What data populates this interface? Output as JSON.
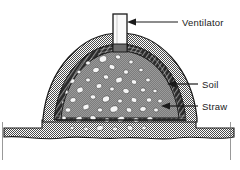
{
  "figure": {
    "type": "technical-cross-section-diagram"
  },
  "labels": [
    {
      "id": "ventilator",
      "text": "Ventilator",
      "x": 182,
      "y": 26
    },
    {
      "id": "soil",
      "text": "Soil",
      "x": 202,
      "y": 88
    },
    {
      "id": "straw",
      "text": "Straw",
      "x": 202,
      "y": 110
    }
  ],
  "parts": {
    "ventilator_pipe": "ventilator-pipe",
    "soil_layer": "soil-layer",
    "straw_layer": "straw-layer",
    "produce_core": "produce-core",
    "ground": "ground"
  },
  "colors": {
    "ink": "#1a1a1a",
    "paper": "#ffffff",
    "soil_fill": "#a8a8a8",
    "straw_fill": "#3a3a3a",
    "core_fill": "#8f8f8f",
    "produce_fill": "#f6f6f6",
    "ground_fill": "#9d9d9d",
    "pipe_fill": "#fafafa"
  },
  "produce_stones": [
    {
      "cx": 103,
      "cy": 59,
      "rx": 4.0,
      "ry": 3.2,
      "rot": -20
    },
    {
      "cx": 118,
      "cy": 57,
      "rx": 2.6,
      "ry": 2.1,
      "rot": 10
    },
    {
      "cx": 88,
      "cy": 63,
      "rx": 2.4,
      "ry": 2.0,
      "rot": 0
    },
    {
      "cx": 131,
      "cy": 62,
      "rx": 2.2,
      "ry": 1.9,
      "rot": 0
    },
    {
      "cx": 112,
      "cy": 67,
      "rx": 3.1,
      "ry": 2.4,
      "rot": 25
    },
    {
      "cx": 96,
      "cy": 70,
      "rx": 3.4,
      "ry": 2.6,
      "rot": -15
    },
    {
      "cx": 126,
      "cy": 72,
      "rx": 2.5,
      "ry": 2.2,
      "rot": 0
    },
    {
      "cx": 79,
      "cy": 72,
      "rx": 2.0,
      "ry": 1.8,
      "rot": 0
    },
    {
      "cx": 141,
      "cy": 70,
      "rx": 2.2,
      "ry": 1.8,
      "rot": 0
    },
    {
      "cx": 106,
      "cy": 77,
      "rx": 2.7,
      "ry": 2.2,
      "rot": 15
    },
    {
      "cx": 119,
      "cy": 80,
      "rx": 3.6,
      "ry": 2.7,
      "rot": -25
    },
    {
      "cx": 88,
      "cy": 80,
      "rx": 2.4,
      "ry": 2.0,
      "rot": 0
    },
    {
      "cx": 134,
      "cy": 82,
      "rx": 2.8,
      "ry": 2.3,
      "rot": 20
    },
    {
      "cx": 72,
      "cy": 81,
      "rx": 2.9,
      "ry": 2.3,
      "rot": -10
    },
    {
      "cx": 148,
      "cy": 80,
      "rx": 2.3,
      "ry": 1.9,
      "rot": 0
    },
    {
      "cx": 99,
      "cy": 86,
      "rx": 3.0,
      "ry": 2.4,
      "rot": -20
    },
    {
      "cx": 112,
      "cy": 89,
      "rx": 2.3,
      "ry": 2.0,
      "rot": 0
    },
    {
      "cx": 126,
      "cy": 91,
      "rx": 3.3,
      "ry": 2.5,
      "rot": 15
    },
    {
      "cx": 80,
      "cy": 90,
      "rx": 3.5,
      "ry": 2.7,
      "rot": -30
    },
    {
      "cx": 143,
      "cy": 90,
      "rx": 2.6,
      "ry": 2.1,
      "rot": 0
    },
    {
      "cx": 66,
      "cy": 92,
      "rx": 2.2,
      "ry": 1.9,
      "rot": 0
    },
    {
      "cx": 155,
      "cy": 91,
      "rx": 2.1,
      "ry": 1.8,
      "rot": 0
    },
    {
      "cx": 93,
      "cy": 97,
      "rx": 2.8,
      "ry": 2.2,
      "rot": 10
    },
    {
      "cx": 106,
      "cy": 99,
      "rx": 3.8,
      "ry": 2.9,
      "rot": -20
    },
    {
      "cx": 120,
      "cy": 101,
      "rx": 2.4,
      "ry": 2.0,
      "rot": 0
    },
    {
      "cx": 134,
      "cy": 100,
      "rx": 3.0,
      "ry": 2.4,
      "rot": 25
    },
    {
      "cx": 73,
      "cy": 100,
      "rx": 3.1,
      "ry": 2.4,
      "rot": -15
    },
    {
      "cx": 149,
      "cy": 100,
      "rx": 2.7,
      "ry": 2.2,
      "rot": 0
    },
    {
      "cx": 61,
      "cy": 102,
      "rx": 2.5,
      "ry": 2.0,
      "rot": 0
    },
    {
      "cx": 160,
      "cy": 101,
      "rx": 2.3,
      "ry": 1.9,
      "rot": 0
    },
    {
      "cx": 86,
      "cy": 107,
      "rx": 3.4,
      "ry": 2.6,
      "rot": -25
    },
    {
      "cx": 100,
      "cy": 110,
      "rx": 2.6,
      "ry": 2.1,
      "rot": 0
    },
    {
      "cx": 114,
      "cy": 109,
      "rx": 4.2,
      "ry": 3.1,
      "rot": -15
    },
    {
      "cx": 129,
      "cy": 110,
      "rx": 2.9,
      "ry": 2.3,
      "rot": 20
    },
    {
      "cx": 143,
      "cy": 109,
      "rx": 3.2,
      "ry": 2.5,
      "rot": -10
    },
    {
      "cx": 68,
      "cy": 110,
      "rx": 2.8,
      "ry": 2.2,
      "rot": 0
    },
    {
      "cx": 156,
      "cy": 110,
      "rx": 2.4,
      "ry": 2.0,
      "rot": 0
    },
    {
      "cx": 93,
      "cy": 118,
      "rx": 3.0,
      "ry": 2.4,
      "rot": 15
    },
    {
      "cx": 107,
      "cy": 120,
      "rx": 2.5,
      "ry": 2.1,
      "rot": 0
    },
    {
      "cx": 121,
      "cy": 119,
      "rx": 3.6,
      "ry": 2.7,
      "rot": -20
    },
    {
      "cx": 136,
      "cy": 120,
      "rx": 2.7,
      "ry": 2.2,
      "rot": 0
    },
    {
      "cx": 79,
      "cy": 119,
      "rx": 3.3,
      "ry": 2.5,
      "rot": -25
    },
    {
      "cx": 150,
      "cy": 119,
      "rx": 2.9,
      "ry": 2.3,
      "rot": 10
    },
    {
      "cx": 64,
      "cy": 118,
      "rx": 2.2,
      "ry": 1.9,
      "rot": 0
    },
    {
      "cx": 100,
      "cy": 128,
      "rx": 3.5,
      "ry": 2.6,
      "rot": -15
    },
    {
      "cx": 115,
      "cy": 129,
      "rx": 2.6,
      "ry": 2.1,
      "rot": 0
    },
    {
      "cx": 130,
      "cy": 128,
      "rx": 3.0,
      "ry": 2.4,
      "rot": 20
    },
    {
      "cx": 86,
      "cy": 129,
      "rx": 2.4,
      "ry": 2.0,
      "rot": 0
    },
    {
      "cx": 144,
      "cy": 128,
      "rx": 2.3,
      "ry": 1.9,
      "rot": 0
    },
    {
      "cx": 72,
      "cy": 128,
      "rx": 2.1,
      "ry": 1.8,
      "rot": 0
    }
  ]
}
